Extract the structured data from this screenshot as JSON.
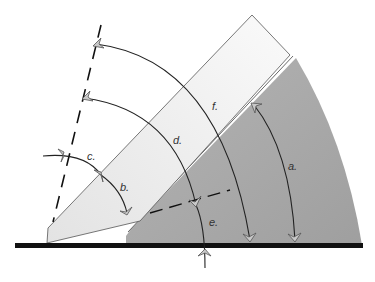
{
  "diagram": {
    "labels": {
      "a": "a.",
      "b": "b.",
      "c": "c.",
      "d": "d.",
      "e": "e.",
      "f": "f."
    },
    "colors": {
      "background": "#ffffff",
      "baseline": "#111111",
      "light_blade": "#ececec",
      "dark_wedge": "#a9a9a9",
      "line": "#222222",
      "arrow_fill": "#c8c8c8"
    }
  }
}
